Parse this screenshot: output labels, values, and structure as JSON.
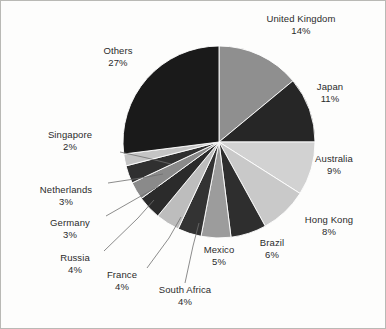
{
  "chart_data": {
    "type": "pie",
    "title": "",
    "subtitle": "",
    "xlabel": "",
    "ylabel": "",
    "legend_position": "none",
    "grid": false,
    "labels_show_percent": true,
    "start_angle_deg": 0,
    "direction": "clockwise",
    "categories": [
      "United Kingdom",
      "Japan",
      "Australia",
      "Hong Kong",
      "Brazil",
      "Mexico",
      "South Africa",
      "France",
      "Russia",
      "Germany",
      "Netherlands",
      "Singapore",
      "Others"
    ],
    "values": [
      14,
      11,
      9,
      8,
      6,
      5,
      4,
      4,
      4,
      3,
      3,
      2,
      27
    ],
    "value_labels": [
      "14%",
      "11%",
      "9%",
      "8%",
      "6%",
      "5%",
      "4%",
      "4%",
      "4%",
      "3%",
      "3%",
      "2%",
      "27%"
    ],
    "total": 100,
    "slice_colors": [
      "#8f8f8f",
      "#262626",
      "#d2d2d2",
      "#c9c9c9",
      "#2e2e2e",
      "#9c9c9c",
      "#333333",
      "#bdbdbd",
      "#2b2b2b",
      "#8a8a8a",
      "#303030",
      "#c4c4c4",
      "#1a1a1a"
    ],
    "slices": [
      {
        "label": "United Kingdom",
        "value": 14,
        "value_label": "14%",
        "color": "#8f8f8f"
      },
      {
        "label": "Japan",
        "value": 11,
        "value_label": "11%",
        "color": "#262626"
      },
      {
        "label": "Australia",
        "value": 9,
        "value_label": "9%",
        "color": "#d2d2d2"
      },
      {
        "label": "Hong Kong",
        "value": 8,
        "value_label": "8%",
        "color": "#c9c9c9"
      },
      {
        "label": "Brazil",
        "value": 6,
        "value_label": "6%",
        "color": "#2e2e2e"
      },
      {
        "label": "Mexico",
        "value": 5,
        "value_label": "5%",
        "color": "#9c9c9c"
      },
      {
        "label": "South Africa",
        "value": 4,
        "value_label": "4%",
        "color": "#333333"
      },
      {
        "label": "France",
        "value": 4,
        "value_label": "4%",
        "color": "#bdbdbd"
      },
      {
        "label": "Russia",
        "value": 4,
        "value_label": "4%",
        "color": "#2b2b2b"
      },
      {
        "label": "Germany",
        "value": 3,
        "value_label": "3%",
        "color": "#8a8a8a"
      },
      {
        "label": "Netherlands",
        "value": 3,
        "value_label": "3%",
        "color": "#303030"
      },
      {
        "label": "Singapore",
        "value": 2,
        "value_label": "2%",
        "color": "#c4c4c4"
      },
      {
        "label": "Others",
        "value": 27,
        "value_label": "27%",
        "color": "#1a1a1a"
      }
    ]
  },
  "labels": {
    "united_kingdom": {
      "name": "United Kingdom",
      "pct": "14%"
    },
    "japan": {
      "name": "Japan",
      "pct": "11%"
    },
    "australia": {
      "name": "Australia",
      "pct": "9%"
    },
    "hong_kong": {
      "name": "Hong Kong",
      "pct": "8%"
    },
    "brazil": {
      "name": "Brazil",
      "pct": "6%"
    },
    "mexico": {
      "name": "Mexico",
      "pct": "5%"
    },
    "south_africa": {
      "name": "South Africa",
      "pct": "4%"
    },
    "france": {
      "name": "France",
      "pct": "4%"
    },
    "russia": {
      "name": "Russia",
      "pct": "4%"
    },
    "germany": {
      "name": "Germany",
      "pct": "3%"
    },
    "netherlands": {
      "name": "Netherlands",
      "pct": "3%"
    },
    "singapore": {
      "name": "Singapore",
      "pct": "2%"
    },
    "others": {
      "name": "Others",
      "pct": "27%"
    }
  },
  "style": {
    "background": "#fdfdfc",
    "frame_color": "#b9b9b5",
    "text_color": "#2b2b2b",
    "leader_line_color": "#6f6f6f"
  },
  "geometry": {
    "center_x": 218,
    "center_y": 141,
    "radius": 96
  }
}
